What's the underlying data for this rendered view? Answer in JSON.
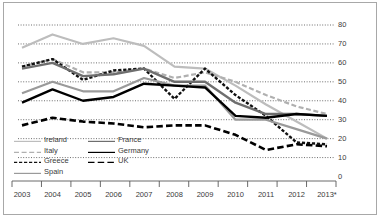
{
  "chart_data": {
    "type": "line",
    "title": "",
    "subtitle": "",
    "xlabel": "",
    "ylabel": "",
    "grid": true,
    "legend_position": "bottom-left",
    "categories": [
      "2003",
      "2004",
      "2005",
      "2006",
      "2007",
      "2008",
      "2009",
      "2010",
      "2011",
      "2012",
      "2013*"
    ],
    "x": [
      2003,
      2004,
      2005,
      2006,
      2007,
      2008,
      2009,
      2010,
      2011,
      2012,
      2013
    ],
    "ylim": [
      0,
      80
    ],
    "yticks": [
      0,
      10,
      20,
      30,
      40,
      50,
      60,
      70,
      80
    ],
    "ytick_labels": [
      "0",
      "10",
      "20",
      "30",
      "40",
      "50",
      "60",
      "70",
      "80"
    ],
    "series": [
      {
        "name": "Ireland",
        "color": "#bdbdbd",
        "style": "solid",
        "width": 2.2,
        "values": [
          68,
          75,
          70,
          73,
          69,
          58,
          57,
          48,
          38,
          29,
          20
        ]
      },
      {
        "name": "Italy",
        "color": "#b0b0b0",
        "style": "dashed",
        "width": 2.2,
        "values": [
          58,
          62,
          55,
          55,
          57,
          52,
          55,
          50,
          43,
          37,
          33
        ]
      },
      {
        "name": "Greece",
        "color": "#111111",
        "style": "dotted-dash",
        "width": 2.4,
        "values": [
          58,
          62,
          51,
          56,
          57,
          41,
          57,
          43,
          32,
          18,
          17
        ]
      },
      {
        "name": "Spain",
        "color": "#9a9a9a",
        "style": "solid",
        "width": 2.2,
        "values": [
          44,
          50,
          45,
          45,
          52,
          48,
          48,
          30,
          30,
          25,
          20
        ]
      },
      {
        "name": "France",
        "color": "#6e6e6e",
        "style": "solid",
        "width": 2.4,
        "values": [
          57,
          60,
          53,
          54,
          57,
          50,
          50,
          39,
          33,
          33,
          32
        ]
      },
      {
        "name": "Germany",
        "color": "#000000",
        "style": "solid",
        "width": 2.4,
        "values": [
          39,
          46,
          40,
          42,
          49,
          48,
          47,
          32,
          31,
          33,
          32
        ]
      },
      {
        "name": "UK",
        "color": "#000000",
        "style": "long-dash",
        "width": 2.6,
        "values": [
          27,
          31,
          29,
          28,
          26,
          27,
          27,
          22,
          14,
          17,
          16
        ]
      }
    ]
  },
  "axes": {
    "x_axis_name": "year-axis",
    "y_axis_name": "value-axis"
  },
  "legend": {
    "entries": [
      {
        "label": "Ireland"
      },
      {
        "label": "Italy"
      },
      {
        "label": "Greece"
      },
      {
        "label": "Spain"
      },
      {
        "label": "France"
      },
      {
        "label": "Germany"
      },
      {
        "label": "UK"
      }
    ]
  }
}
